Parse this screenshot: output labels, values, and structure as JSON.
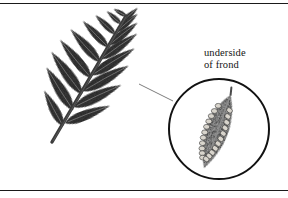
{
  "figure": {
    "kind": "botanical-illustration",
    "background_color": "#ffffff",
    "ink_color": "#333333",
    "rule_color": "#1a1a1a"
  },
  "label": {
    "line1": "underside",
    "line2": "of frond",
    "full_text": "underside of frond"
  },
  "frond": {
    "name": "fern frond",
    "rachis": {
      "base_x": 52,
      "base_y": 142,
      "tip_x": 126,
      "tip_y": 16,
      "color": "#3b3b3b"
    },
    "leaflet_count": 17,
    "leaflet_color": "#3a3a3a",
    "leaflets": [
      {
        "bx": 63,
        "by": 126,
        "len": 40,
        "w": 13,
        "rot": -118,
        "side": "left"
      },
      {
        "bx": 73,
        "by": 110,
        "len": 50,
        "w": 15,
        "rot": -122,
        "side": "left"
      },
      {
        "bx": 82,
        "by": 94,
        "len": 52,
        "w": 15,
        "rot": -126,
        "side": "left"
      },
      {
        "bx": 91,
        "by": 78,
        "len": 49,
        "w": 14,
        "rot": -129,
        "side": "left"
      },
      {
        "bx": 100,
        "by": 62,
        "len": 44,
        "w": 13,
        "rot": -132,
        "side": "left"
      },
      {
        "bx": 108,
        "by": 47,
        "len": 36,
        "w": 11,
        "rot": -134,
        "side": "left"
      },
      {
        "bx": 115,
        "by": 34,
        "len": 27,
        "w": 9,
        "rot": -136,
        "side": "left"
      },
      {
        "bx": 121,
        "by": 24,
        "len": 19,
        "w": 7,
        "rot": -138,
        "side": "left"
      },
      {
        "bx": 126,
        "by": 16,
        "len": 14,
        "w": 6,
        "rot": -150,
        "side": "tip"
      },
      {
        "bx": 122,
        "by": 22,
        "len": 21,
        "w": 7,
        "rot": -42,
        "side": "right"
      },
      {
        "bx": 116,
        "by": 32,
        "len": 28,
        "w": 9,
        "rot": -40,
        "side": "right"
      },
      {
        "bx": 109,
        "by": 45,
        "len": 36,
        "w": 11,
        "rot": -38,
        "side": "right"
      },
      {
        "bx": 101,
        "by": 59,
        "len": 44,
        "w": 13,
        "rot": -35,
        "side": "right"
      },
      {
        "bx": 92,
        "by": 75,
        "len": 50,
        "w": 14,
        "rot": -32,
        "side": "right"
      },
      {
        "bx": 83,
        "by": 91,
        "len": 52,
        "w": 15,
        "rot": -29,
        "side": "right"
      },
      {
        "bx": 74,
        "by": 107,
        "len": 52,
        "w": 15,
        "rot": -25,
        "side": "right"
      },
      {
        "bx": 65,
        "by": 123,
        "len": 48,
        "w": 14,
        "rot": -21,
        "side": "right"
      }
    ]
  },
  "leader_line": {
    "name": "callout-leader",
    "from_x": 139,
    "from_y": 84,
    "to_x": 173,
    "to_y": 101,
    "color": "#6e6e6e"
  },
  "magnifier": {
    "name": "magnified-circle",
    "center_x": 219,
    "center_y": 129,
    "radius": 50,
    "stroke_color": "#121212",
    "stroke_width": 2,
    "fill": "#ffffff"
  },
  "magnified_leaflet": {
    "name": "magnified-leaflet-with-sori",
    "center_x": 216,
    "center_y": 131,
    "length": 78,
    "width": 32,
    "rotation_deg": 22,
    "body_color": "#4a4a4a",
    "midvein_color": "#8d8d8d",
    "sori_color": "#d8d4cc",
    "sori_outline": "#2e2e2e",
    "sori_count": 22,
    "sori_rows": 2,
    "sori": [
      {
        "u": -0.62,
        "v": -0.46
      },
      {
        "u": -0.62,
        "v": 0.3
      },
      {
        "u": -0.46,
        "v": -0.56
      },
      {
        "u": -0.46,
        "v": 0.34
      },
      {
        "u": -0.31,
        "v": -0.62
      },
      {
        "u": -0.31,
        "v": 0.42
      },
      {
        "u": -0.16,
        "v": -0.64
      },
      {
        "u": -0.16,
        "v": 0.46
      },
      {
        "u": -0.01,
        "v": -0.64
      },
      {
        "u": -0.01,
        "v": 0.48
      },
      {
        "u": 0.14,
        "v": -0.62
      },
      {
        "u": 0.14,
        "v": 0.46
      },
      {
        "u": 0.28,
        "v": -0.58
      },
      {
        "u": 0.28,
        "v": 0.42
      },
      {
        "u": 0.42,
        "v": -0.5
      },
      {
        "u": 0.42,
        "v": 0.36
      },
      {
        "u": 0.55,
        "v": -0.4
      },
      {
        "u": 0.55,
        "v": 0.28
      },
      {
        "u": 0.66,
        "v": -0.28
      },
      {
        "u": 0.66,
        "v": 0.19
      },
      {
        "u": 0.76,
        "v": -0.15
      },
      {
        "u": 0.76,
        "v": 0.09
      }
    ]
  }
}
